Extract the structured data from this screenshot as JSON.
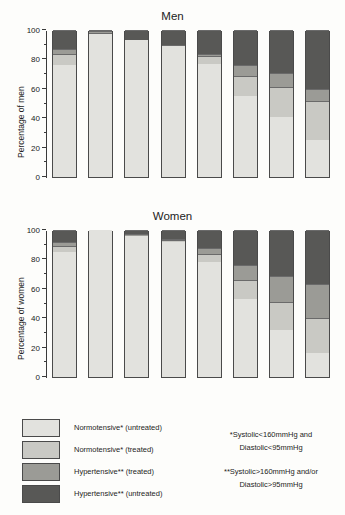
{
  "top_fragment": "",
  "panels": [
    {
      "title": "Men",
      "ylabel": "Percentage of men",
      "name": "men"
    },
    {
      "title": "Women",
      "ylabel": "Percentage of women",
      "name": "women"
    }
  ],
  "legend": {
    "items": [
      {
        "label": "Normotensive* (untreated)",
        "color": "#e2e2de"
      },
      {
        "label": "Normotensive* (treated)",
        "color": "#c9c9c4"
      },
      {
        "label": "Hypertensive** (treated)",
        "color": "#9b9b96"
      },
      {
        "label": "Hypertensive** (untreated)",
        "color": "#585856"
      }
    ]
  },
  "notes": [
    "*Systolic<160mmHg and",
    "Diastolic<95mmHg",
    "**Systolic>160mmHg and/or",
    "Diastolic>95mmHg"
  ],
  "chart_data": {
    "type": "bar",
    "subtype": "stacked",
    "title": "Men",
    "xlabel": "",
    "ylabel": "Percentage",
    "ylim": [
      0,
      100
    ],
    "yticks": [
      0,
      20,
      40,
      60,
      80,
      100
    ],
    "yminorticks": [
      10,
      30,
      50,
      70,
      90
    ],
    "grid": false,
    "legend_position": "bottom-left",
    "categories": [
      "All ages",
      "16-24",
      "25-34",
      "35-44",
      "45-54",
      "55-64",
      "65-74",
      "75+"
    ],
    "series_order": [
      "Normotensive* (untreated)",
      "Normotensive* (treated)",
      "Hypertensive** (treated)",
      "Hypertensive** (untreated)"
    ],
    "panels": [
      {
        "name": "Men",
        "ylabel": "Percentage of men",
        "series": [
          {
            "name": "Normotensive* (untreated)",
            "color": "#e2e2de",
            "values": [
              76,
              97,
              93,
              89,
              77,
              55,
              41,
              25
            ]
          },
          {
            "name": "Normotensive* (treated)",
            "color": "#c9c9c4",
            "values": [
              8,
              1,
              0,
              0,
              5,
              14,
              20,
              27
            ]
          },
          {
            "name": "Hypertensive** (treated)",
            "color": "#9b9b96",
            "values": [
              3,
              1,
              0,
              1,
              2,
              7,
              10,
              8
            ]
          },
          {
            "name": "Hypertensive** (untreated)",
            "color": "#585856",
            "values": [
              13,
              1,
              7,
              10,
              16,
              24,
              29,
              40
            ]
          }
        ]
      },
      {
        "name": "Women",
        "ylabel": "Percentage of women",
        "series": [
          {
            "name": "Normotensive* (untreated)",
            "color": "#e2e2de",
            "values": [
              85,
              100,
              96,
              92,
              78,
              53,
              32,
              16
            ]
          },
          {
            "name": "Normotensive* (treated)",
            "color": "#c9c9c4",
            "values": [
              4,
              0,
              0,
              1,
              6,
              13,
              19,
              24
            ]
          },
          {
            "name": "Hypertensive** (treated)",
            "color": "#9b9b96",
            "values": [
              3,
              0,
              1,
              1,
              4,
              10,
              18,
              23
            ]
          },
          {
            "name": "Hypertensive** (untreated)",
            "color": "#585856",
            "values": [
              8,
              0,
              3,
              6,
              12,
              24,
              31,
              37
            ]
          }
        ]
      }
    ]
  }
}
